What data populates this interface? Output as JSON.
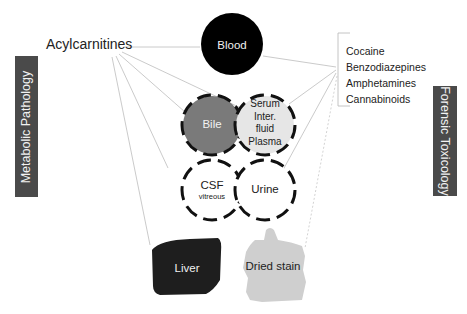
{
  "diagram": {
    "left_category": {
      "label": "Metabolic Pathology",
      "color": "#4a4a4a"
    },
    "right_category": {
      "label": "Forensic Toxicology",
      "color": "#4a4a4a"
    },
    "left_analyte": {
      "label": "Acylcarnitines"
    },
    "right_analytes": {
      "items": [
        {
          "label": "Cocaine"
        },
        {
          "label": "Benzodiazepines"
        },
        {
          "label": "Amphetamines"
        },
        {
          "label": "Cannabinoids"
        }
      ]
    },
    "specimens": {
      "blood": {
        "label": "Blood",
        "fill": "#000000"
      },
      "bile": {
        "label": "Bile",
        "fill": "#7a7a7a"
      },
      "serum": {
        "lines": [
          "Serum",
          "Inter.",
          "fluid",
          "Plasma"
        ],
        "fill": "#e6e6e6"
      },
      "csf": {
        "label": "CSF",
        "sublabel": "vitreous",
        "fill": "#ffffff"
      },
      "urine": {
        "label": "Urine",
        "fill": "#ffffff"
      },
      "liver": {
        "label": "Liver",
        "fill": "#1e1e1e"
      },
      "dried_stain": {
        "label": "Dried stain",
        "fill": "#cfcfcf"
      }
    },
    "connections": {
      "from_acylcarnitines": [
        "Blood",
        "Bile",
        "Serum",
        "CSF",
        "Urine",
        "Liver",
        "Dried stain"
      ],
      "from_forensic_list": [
        "Blood",
        "Serum",
        "Urine",
        "Dried stain"
      ]
    }
  }
}
